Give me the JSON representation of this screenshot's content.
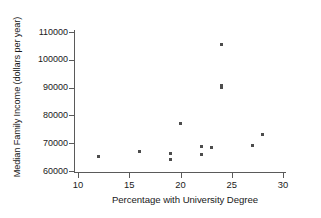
{
  "chart_data": {
    "type": "scatter",
    "title": "",
    "xlabel": "Percentage with University Degree",
    "ylabel": "Median Family Income (dollars per year)",
    "xlim": [
      9,
      31
    ],
    "ylim": [
      58000,
      112000
    ],
    "xticks": [
      10,
      15,
      20,
      25,
      30
    ],
    "xtick_labels": [
      "10",
      "15",
      "20",
      "25",
      "30"
    ],
    "yticks": [
      60000,
      70000,
      80000,
      90000,
      100000,
      110000
    ],
    "ytick_labels": [
      "60000",
      "70000",
      "80000",
      "90000",
      "100000",
      "110000"
    ],
    "grid": false,
    "legend": null,
    "marker": {
      "shape": "square",
      "color": "#4d4d4d",
      "size_px": 3
    },
    "points": [
      {
        "x": 12.0,
        "y": 65200
      },
      {
        "x": 16.0,
        "y": 67200
      },
      {
        "x": 19.0,
        "y": 66400
      },
      {
        "x": 19.0,
        "y": 64000
      },
      {
        "x": 20.0,
        "y": 77100
      },
      {
        "x": 22.0,
        "y": 68900
      },
      {
        "x": 22.0,
        "y": 66000
      },
      {
        "x": 23.0,
        "y": 68400
      },
      {
        "x": 24.0,
        "y": 105500
      },
      {
        "x": 24.0,
        "y": 90600
      },
      {
        "x": 24.0,
        "y": 89900
      },
      {
        "x": 27.0,
        "y": 69300
      },
      {
        "x": 28.0,
        "y": 73300
      }
    ]
  },
  "axes": {
    "x_axis_name": "x-axis",
    "y_axis_name": "y-axis"
  }
}
